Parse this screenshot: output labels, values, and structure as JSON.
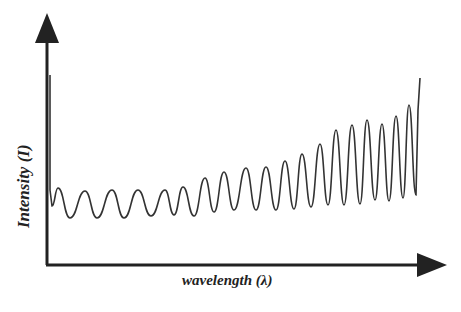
{
  "chart_data": {
    "type": "line",
    "title": "",
    "xlabel": "wavelength (λ)",
    "ylabel": "Intensity (I)",
    "grid": false,
    "legend": null,
    "axis_ticks": "none",
    "series": [
      {
        "name": "intensity",
        "color": "#333333",
        "peaks_px": [
          [
            58,
            188
          ],
          [
            85,
            191
          ],
          [
            112,
            190
          ],
          [
            138,
            190
          ],
          [
            165,
            190
          ],
          [
            183,
            187
          ],
          [
            205,
            178
          ],
          [
            224,
            172
          ],
          [
            246,
            168
          ],
          [
            266,
            167
          ],
          [
            285,
            161
          ],
          [
            302,
            154
          ],
          [
            320,
            144
          ],
          [
            336,
            130
          ],
          [
            352,
            125
          ],
          [
            367,
            120
          ],
          [
            382,
            124
          ],
          [
            396,
            116
          ],
          [
            409,
            105
          ]
        ],
        "troughs_px": [
          [
            70,
            218
          ],
          [
            97,
            218
          ],
          [
            124,
            218
          ],
          [
            151,
            216
          ],
          [
            174,
            215
          ],
          [
            194,
            216
          ],
          [
            214,
            212
          ],
          [
            234,
            210
          ],
          [
            256,
            210
          ],
          [
            276,
            210
          ],
          [
            294,
            209
          ],
          [
            311,
            207
          ],
          [
            328,
            205
          ],
          [
            344,
            205
          ],
          [
            360,
            204
          ],
          [
            375,
            200
          ],
          [
            389,
            201
          ],
          [
            403,
            198
          ],
          [
            416,
            195
          ]
        ],
        "start_spike_px": [
          [
            50,
            75
          ],
          [
            50,
            190
          ],
          [
            52,
            206
          ]
        ],
        "end_px": [
          [
            418,
            110
          ],
          [
            420,
            78
          ]
        ]
      }
    ]
  },
  "labels": {
    "y_axis": "Intensity (I)",
    "x_axis": "wavelength (λ)"
  }
}
